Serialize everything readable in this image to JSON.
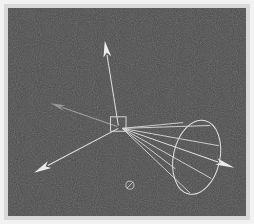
{
  "figure": {
    "caption": "",
    "background_color": "#4c4c4c",
    "frame_color": "#d9d9d9",
    "line_color": "#e8e8e8",
    "dim_line_color": "#9a9a9a",
    "canvas": {
      "width": 254,
      "height": 224
    }
  },
  "scene": {
    "origin_label": "origin",
    "origin": {
      "x": 118,
      "y": 127
    },
    "selection_box": {
      "label": "selection-box",
      "x": 110,
      "y": 117,
      "width": 16,
      "height": 15
    },
    "axes": [
      {
        "name": "axis-up",
        "label": "up-axis",
        "from": {
          "x": 118,
          "y": 126
        },
        "to": {
          "x": 104,
          "y": 38
        },
        "head_length": 17,
        "head_width": 8,
        "style": "bright"
      },
      {
        "name": "axis-back-left",
        "label": "back-left-axis",
        "from": {
          "x": 117,
          "y": 127
        },
        "to": {
          "x": 48,
          "y": 103
        },
        "head_length": 15,
        "head_width": 6,
        "style": "dim"
      },
      {
        "name": "axis-front-left",
        "label": "front-left-axis",
        "from": {
          "x": 118,
          "y": 129
        },
        "to": {
          "x": 31,
          "y": 175
        },
        "head_length": 18,
        "head_width": 8,
        "style": "bright"
      },
      {
        "name": "axis-right",
        "label": "right-axis",
        "from": {
          "x": 122,
          "y": 129
        },
        "to": {
          "x": 238,
          "y": 170
        },
        "head_length": 20,
        "head_width": 7,
        "style": "bright"
      }
    ],
    "cone": {
      "name": "uncertainty-cone",
      "label": "uncertainty-cone",
      "apex": {
        "x": 122,
        "y": 129
      },
      "base_center": {
        "x": 199,
        "y": 159
      },
      "base_rx": 24,
      "base_ry": 39,
      "base_rotation_deg": 12,
      "generatrix_count": 6,
      "generatrix_endpoints": [
        {
          "x": 185,
          "y": 123
        },
        {
          "x": 213,
          "y": 126
        },
        {
          "x": 222,
          "y": 147
        },
        {
          "x": 214,
          "y": 181
        },
        {
          "x": 192,
          "y": 196
        },
        {
          "x": 177,
          "y": 171
        }
      ]
    },
    "markers": [
      {
        "name": "slashed-circle-marker",
        "label": "slashed-circle-marker",
        "x": 130,
        "y": 188,
        "radius": 4.2
      }
    ]
  }
}
